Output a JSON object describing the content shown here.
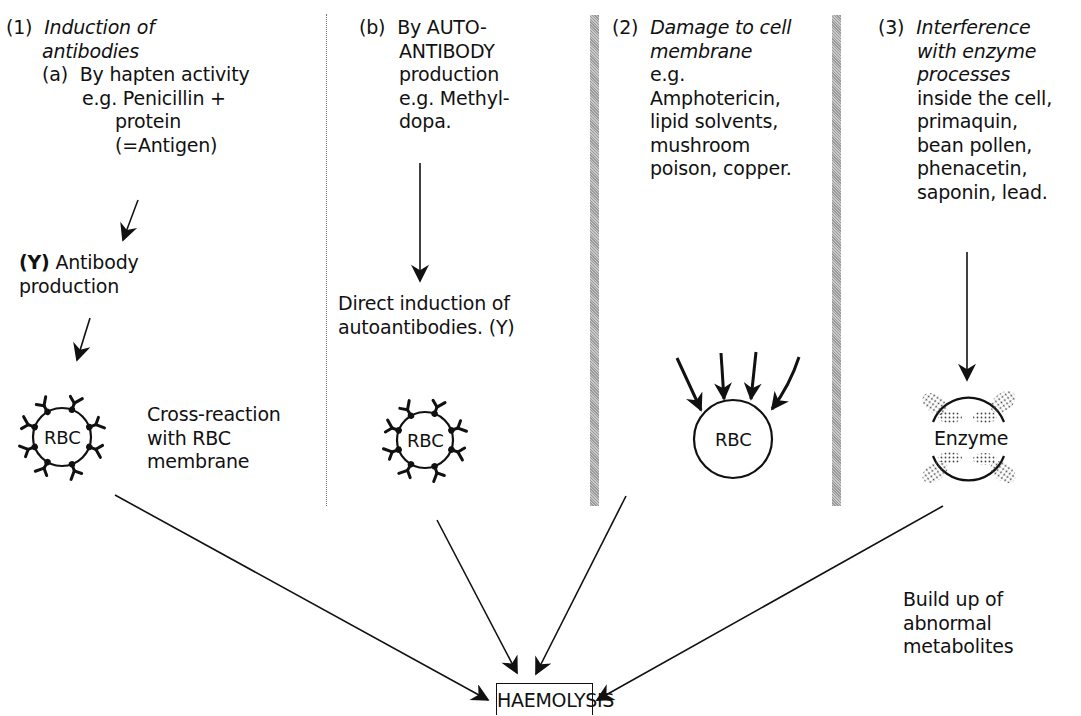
{
  "columns": [
    {
      "id": "induction",
      "number": "(1)",
      "title_lines": [
        "Induction of",
        "antibodies"
      ],
      "sub": {
        "label": "(a)",
        "lines": [
          "By hapten activity",
          "e.g. Penicillin +",
          "protein",
          "(=Antigen)"
        ]
      },
      "step": {
        "symbol": "(Υ)",
        "lines": [
          "Antibody",
          "production"
        ]
      },
      "cell_label": "RBC",
      "side_note": [
        "Cross-reaction",
        "with RBC",
        "membrane"
      ]
    },
    {
      "id": "autoantibody",
      "sub": {
        "label": "(b)",
        "lines": [
          "By AUTO-",
          "ANTIBODY",
          "production",
          "e.g. Methyl-",
          "dopa."
        ]
      },
      "step": {
        "lines": [
          "Direct induction of",
          "autoantibodies. (Υ)"
        ]
      },
      "cell_label": "RBC"
    },
    {
      "id": "membrane-damage",
      "number": "(2)",
      "title_lines": [
        "Damage to cell",
        "membrane"
      ],
      "lines": [
        "e.g.",
        "Amphotericin,",
        "lipid solvents,",
        "mushroom",
        "poison, copper."
      ],
      "cell_label": "RBC"
    },
    {
      "id": "enzyme-interference",
      "number": "(3)",
      "title_lines": [
        "Interference",
        "with enzyme",
        "processes"
      ],
      "lines": [
        "inside the cell,",
        "primaquin,",
        "bean pollen,",
        "phenacetin,",
        "saponin, lead."
      ],
      "cell_label": "Enzyme",
      "side_note": [
        "Build up of",
        "abnormal",
        "metabolites"
      ]
    }
  ],
  "outcome": "HAEMOLYSIS",
  "colors": {
    "ink": "#111111",
    "divider_gray": "#9a9a9a"
  }
}
